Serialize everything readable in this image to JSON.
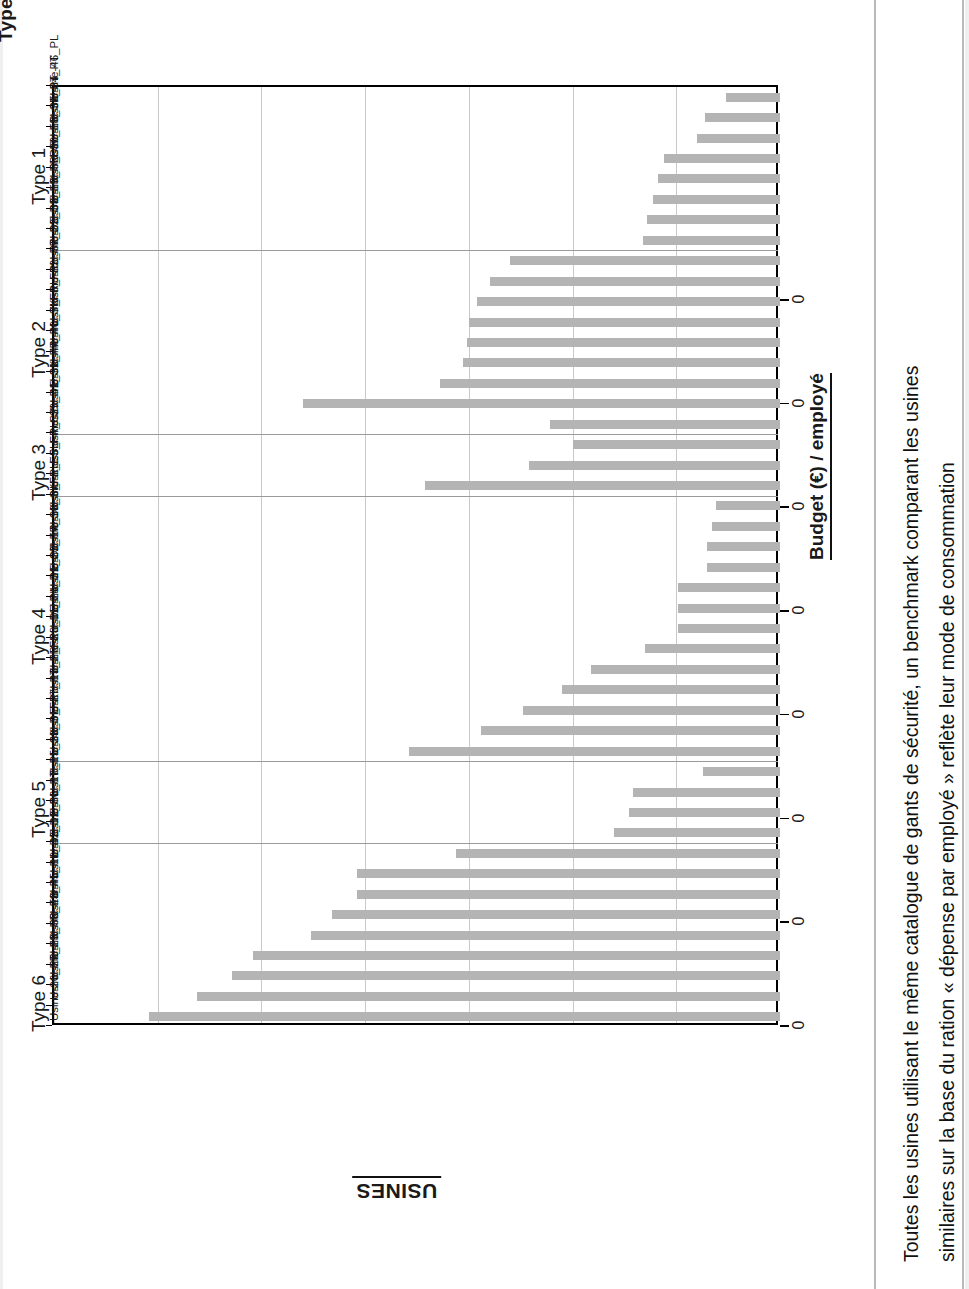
{
  "titles": {
    "group_axis_title": "Types d'usine",
    "category_axis_title": "USINES",
    "value_axis_title": "Budget (€) / employé"
  },
  "caption": {
    "line1": "Toutes les usines utilisant le même catalogue de gants de sécurité, un benchmark comparant les usines",
    "line2": "similaires sur la base du ration « dépense par employé » reflète leur mode de consommation"
  },
  "chart_data": {
    "type": "bar",
    "orientation": "horizontal",
    "title": "",
    "xlabel": "Budget (€) / employé",
    "ylabel": "USINES",
    "grid": true,
    "legend": null,
    "value_tick_labels": [
      "0",
      "0",
      "0",
      "0",
      "0",
      "0",
      "0",
      "0"
    ],
    "note": "All value tick labels are anonymised and printed as 0; bar values below are read off the gridlines in gridline units (1 unit = one major gridline interval, 0 at the category axis).",
    "axis_range_units": [
      0,
      7
    ],
    "groups": [
      {
        "label": "Type 1",
        "count": 8
      },
      {
        "label": "Type 2",
        "count": 9
      },
      {
        "label": "Type 3",
        "count": 3
      },
      {
        "label": "Type 4",
        "count": 13
      },
      {
        "label": "Type 5",
        "count": 4
      },
      {
        "label": "Type 6",
        "count": 15
      }
    ],
    "categories": [
      "Usine-46_PL",
      "Usine-34_PT",
      "Usine-35_PT",
      "Usine-18_SK",
      "Usine-30_FR",
      "Usine-3_DE",
      "Usine-19_FR",
      "Usine-33_FR",
      "Usine-22_DE",
      "Usine-37_DE",
      "Usine-32_FR",
      "Usine-6_FR",
      "Usine-7_FR",
      "Usine-40_SK",
      "Usine-44_PL",
      "Usine-31_FR",
      "Usine-41_SK",
      "Usine-39_DE",
      "Usine-4_CZ",
      "Usine-5_FR",
      "Usine-1_ES",
      "Usine-8_FR",
      "Usine-16_SK",
      "Usine-14_SK",
      "Usine-20_FR",
      "Usine-21_CZ",
      "Usine-24_DE",
      "Usine-11_PL",
      "Usine-28_DE",
      "Usine-2_FR",
      "Usine-13_FR",
      "Usine-27_PT",
      "Usine-9_FR",
      "Usine-23_DE",
      "Usine-15_SK",
      "Usine-17_PL",
      "Usine-36_PT",
      "Usine-12_PL",
      "Usine-42_DE",
      "Usine-10_DE",
      "Usine-45_PL",
      "Usine-43_PL",
      "Usine-38_ES",
      "Usine-29_FR",
      "Usine-25_FR",
      "Usine-26_FR"
    ],
    "values": [
      0.52,
      0.72,
      0.8,
      1.12,
      1.18,
      1.22,
      1.28,
      1.32,
      2.6,
      2.8,
      2.92,
      3.0,
      3.02,
      3.06,
      3.28,
      4.6,
      2.22,
      2.0,
      2.42,
      3.42,
      0.62,
      0.66,
      0.7,
      0.7,
      0.98,
      0.98,
      0.98,
      1.3,
      1.82,
      2.1,
      2.48,
      2.88,
      3.58,
      0.74,
      1.42,
      1.46,
      1.6,
      3.12,
      4.08,
      4.08,
      4.32,
      4.52,
      5.08,
      5.28,
      5.62,
      6.08
    ]
  }
}
